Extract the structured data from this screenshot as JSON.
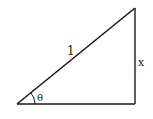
{
  "diagram": {
    "type": "right-triangle",
    "vertices": {
      "angle_vertex": [
        17,
        104
      ],
      "right_angle_vertex": [
        135,
        104
      ],
      "top_vertex": [
        135,
        8
      ]
    },
    "labels": {
      "hypotenuse": "1",
      "opposite": "x",
      "angle": "θ"
    },
    "colors": {
      "stroke": "#1a1a1a",
      "background": "#ffffff"
    }
  }
}
